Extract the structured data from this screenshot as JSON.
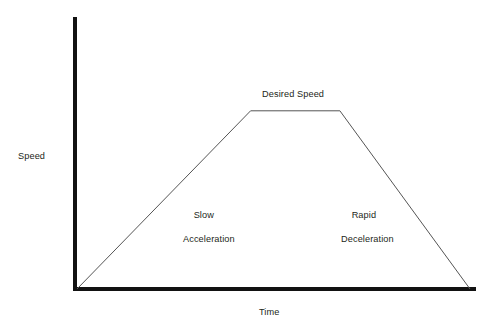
{
  "chart_data": {
    "type": "line",
    "title": "",
    "subtitle": "",
    "xlabel": "Time",
    "ylabel": "Speed",
    "grid": false,
    "legend": "none",
    "axis_style": {
      "spines": [
        "left",
        "bottom"
      ],
      "ticks": "none",
      "tick_labels": "none",
      "axis_color": "#121212",
      "axis_thickness_px": 4
    },
    "xlim": [
      0,
      1
    ],
    "ylim": [
      0,
      1
    ],
    "series": [
      {
        "name": "Speed profile",
        "color": "#555555",
        "line_width_px": 1,
        "x": [
          0.0,
          0.435,
          0.659,
          0.985
        ],
        "y": [
          0.0,
          0.655,
          0.655,
          0.0
        ],
        "points_note": "trapezoidal velocity profile: ramp up, constant cruise, steeper ramp down"
      }
    ],
    "annotations": [
      {
        "name": "desired-speed",
        "text": "Desired Speed",
        "x": 0.55,
        "y": 0.73,
        "align": "center"
      },
      {
        "name": "slow-acceleration",
        "text": "Slow\nAcceleration",
        "x": 0.27,
        "y": 0.32,
        "align": "left"
      },
      {
        "name": "rapid-deceleration",
        "text": "Rapid\nDeceleration",
        "x": 0.665,
        "y": 0.32,
        "align": "left"
      }
    ]
  },
  "labels": {
    "y_axis": "Speed",
    "x_axis": "Time",
    "desired_speed": "Desired Speed",
    "accel_line1": "Slow",
    "accel_line2": "Acceleration",
    "decel_line1": "Rapid",
    "decel_line2": "Deceleration"
  },
  "colors": {
    "background": "#ffffff",
    "axis": "#121212",
    "curve": "#555555",
    "text": "#231f20"
  }
}
